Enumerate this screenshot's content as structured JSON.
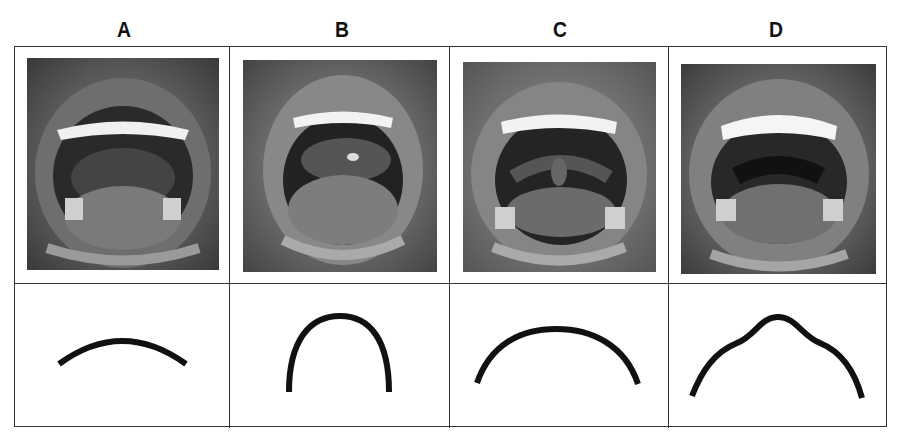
{
  "columns": [
    {
      "label": "A",
      "photo_alt": "open-mouth-oral-cavity-A",
      "palate_shape": "shallow-wide-arch"
    },
    {
      "label": "B",
      "photo_alt": "open-mouth-oral-cavity-B",
      "palate_shape": "narrow-high-arch"
    },
    {
      "label": "C",
      "photo_alt": "open-mouth-oral-cavity-C",
      "palate_shape": "wide-broad-arch"
    },
    {
      "label": "D",
      "photo_alt": "open-mouth-oral-cavity-D",
      "palate_shape": "peaked-arch-with-shoulders"
    }
  ],
  "colors": {
    "border": "#333333",
    "curve": "#111111",
    "background": "#ffffff"
  }
}
